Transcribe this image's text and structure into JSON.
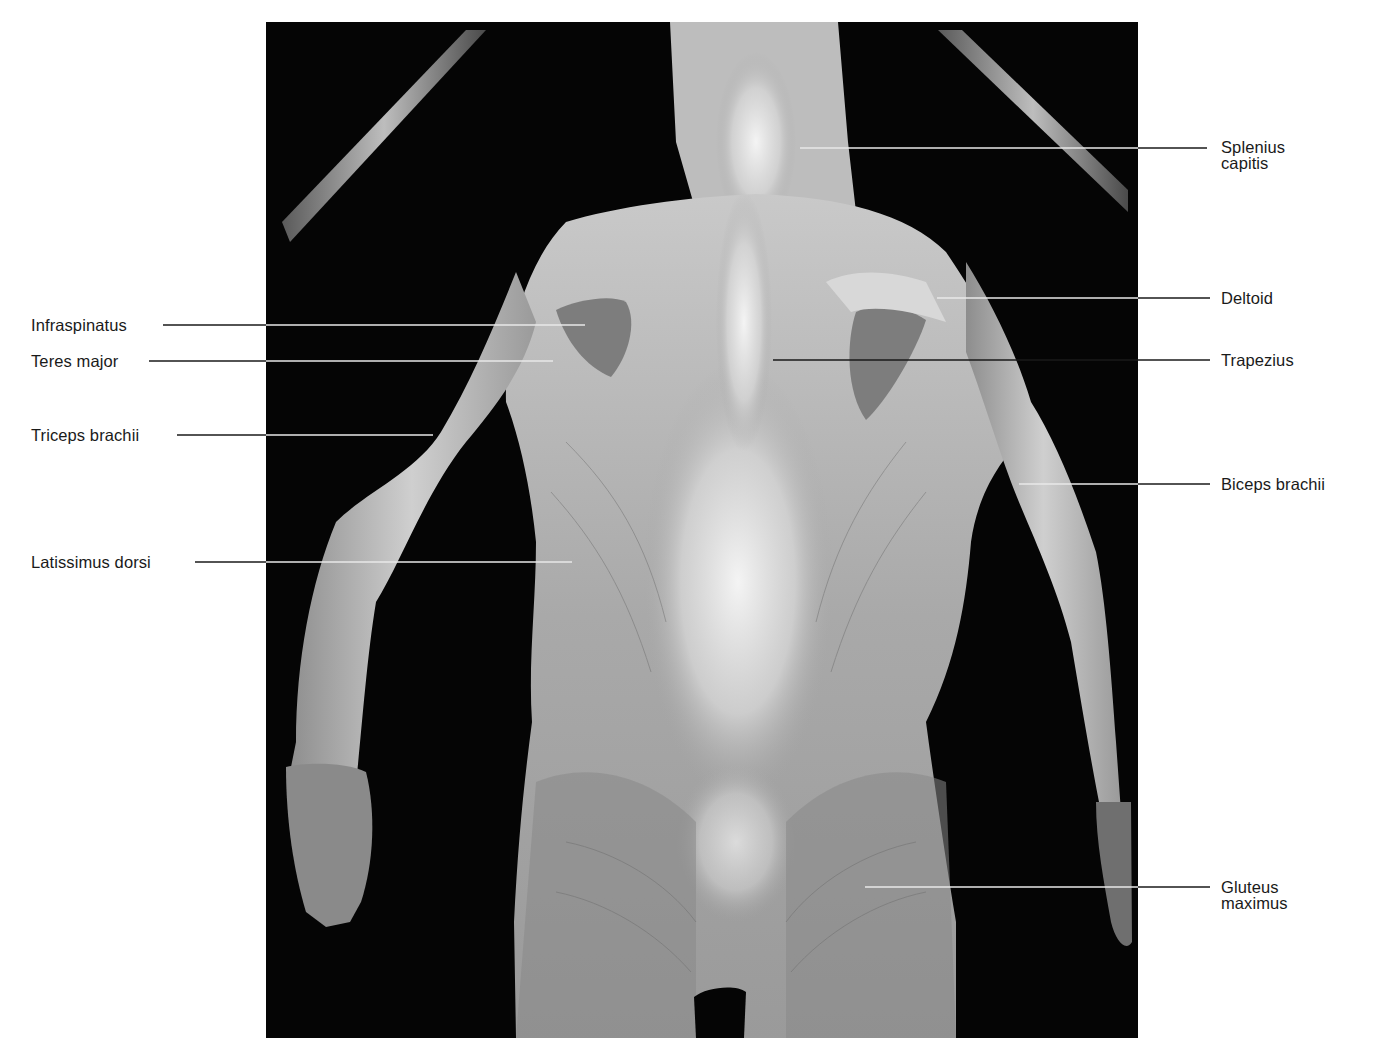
{
  "figure": {
    "background_color": "#ffffff",
    "photo_background": "#050505",
    "leader_color_on_white": "#1a1a1a",
    "leader_color_on_photo": "#e8e8e8"
  },
  "labels": {
    "left": [
      {
        "id": "infraspinatus",
        "text": "Infraspinatus",
        "y": 325,
        "line_end_x": 585
      },
      {
        "id": "teres-major",
        "text": "Teres major",
        "y": 361,
        "line_end_x": 553
      },
      {
        "id": "triceps-brachii",
        "text": "Triceps brachii",
        "y": 435,
        "line_end_x": 433
      },
      {
        "id": "latissimus-dorsi",
        "text": "Latissimus dorsi",
        "y": 562,
        "line_end_x": 572
      }
    ],
    "right": [
      {
        "id": "splenius-capitis",
        "text_line1": "Splenius",
        "text_line2": "capitis",
        "y": 148,
        "line_start_x": 800
      },
      {
        "id": "deltoid",
        "text_line1": "Deltoid",
        "text_line2": "",
        "y": 298,
        "line_start_x": 937
      },
      {
        "id": "trapezius",
        "text_line1": "Trapezius",
        "text_line2": "",
        "y": 360,
        "line_start_x": 773
      },
      {
        "id": "biceps-brachii",
        "text_line1": "Biceps brachii",
        "text_line2": "",
        "y": 484,
        "line_start_x": 1019
      },
      {
        "id": "gluteus-maximus",
        "text_line1": "Gluteus",
        "text_line2": "maximus",
        "y": 887,
        "line_start_x": 865
      }
    ]
  }
}
